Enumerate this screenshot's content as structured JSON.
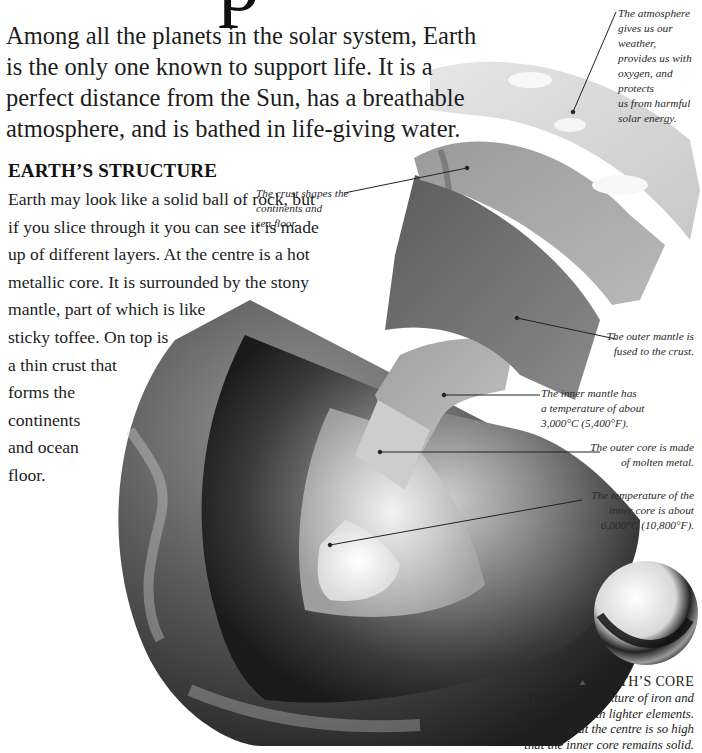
{
  "page": {
    "title_fragment": "p",
    "intro_lines": [
      "Among all the planets in the solar system, Earth",
      "is the only one known to support life. It is a",
      "perfect distance from the Sun, has a breathable",
      "atmosphere, and is bathed in life-giving water."
    ]
  },
  "structure": {
    "heading": "EARTH’S STRUCTURE",
    "body_lines": [
      "Earth may look like a solid ball of rock, but",
      "if you slice through it you can see it is made",
      "up of different layers. At the centre is a hot",
      "metallic core. It is surrounded by the stony",
      "mantle, part of which is like",
      "sticky toffee. On top is",
      "a thin crust that",
      "forms the",
      "continents",
      "and ocean",
      "floor."
    ]
  },
  "labels": {
    "atmosphere": [
      "The atmosphere",
      "gives us our weather,",
      "provides us with",
      "oxygen, and protects",
      "us from harmful",
      "solar energy."
    ],
    "crust": [
      "The crust shapes the",
      "continents and",
      "sea floor."
    ],
    "outer_mantle": [
      "The outer mantle is",
      "fused to the crust."
    ],
    "inner_mantle": [
      "The inner mantle has",
      "a temperature of about",
      "3,000°C (5,400°F)."
    ],
    "outer_core": [
      "The outer core is made",
      "of molten metal."
    ],
    "inner_core": [
      "The temperature of the",
      "inner core is about",
      "6,000°C (10,800°F)."
    ]
  },
  "core_inset": {
    "marker": "▲",
    "title": "EARTH’S CORE",
    "description": [
      "The core is a mixture of iron and",
      "nickel mixed with lighter elements.",
      "The pressure at the centre is so high",
      "that the inner core remains solid."
    ]
  },
  "colors": {
    "background": "#ffffff",
    "text": "#1a1a1a",
    "leader_line": "#222222"
  }
}
